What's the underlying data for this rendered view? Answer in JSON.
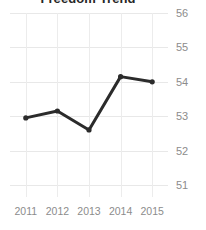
{
  "chart_data": {
    "type": "line",
    "title": "Freedom Trend",
    "xlabel": "",
    "ylabel": "",
    "categories": [
      "2011",
      "2012",
      "2013",
      "2014",
      "2015"
    ],
    "x": [
      2011,
      2012,
      2013,
      2014,
      2015
    ],
    "values": [
      52.95,
      53.15,
      52.6,
      54.15,
      54.0
    ],
    "series": [
      {
        "name": "Freedom Trend",
        "values": [
          52.95,
          53.15,
          52.6,
          54.15,
          54.0
        ]
      }
    ],
    "ylim": [
      50.65,
      56.0
    ],
    "yticks": [
      56,
      55,
      54,
      53,
      52,
      51
    ],
    "ytick_labels": [
      "56",
      "55",
      "54",
      "53",
      "52",
      "51"
    ],
    "xticks": [
      2011,
      2012,
      2013,
      2014,
      2015
    ],
    "xtick_labels": [
      "2011",
      "2012",
      "2013",
      "2014",
      "2015"
    ],
    "grid": true,
    "grid_axis": "both",
    "legend": false,
    "legend_position": "none",
    "y_axis_side": "right",
    "markers": true,
    "colors": {
      "line": "#2b2b2b",
      "marker": "#2b2b2b",
      "grid": "#e8e8e8",
      "grid_vertical": "#ececec",
      "tick_label": "#8c8c8c",
      "title": "#262626",
      "background": "#ffffff"
    }
  }
}
